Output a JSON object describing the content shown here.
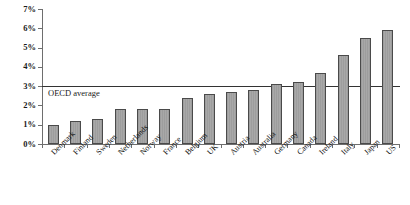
{
  "chart_data": {
    "type": "bar",
    "title": "",
    "subtitle": "",
    "xlabel": "",
    "ylabel": "",
    "ylim": [
      0,
      7
    ],
    "ytick_labels": [
      "0%",
      "1%",
      "2%",
      "3%",
      "4%",
      "5%",
      "6%",
      "7%"
    ],
    "ytick_values": [
      0,
      1,
      2,
      3,
      4,
      5,
      6,
      7
    ],
    "grid": false,
    "legend": "none",
    "value_unit": "%",
    "categories": [
      "Denmark",
      "Finland",
      "Sweden",
      "Netherlands",
      "Norway",
      "France",
      "Belgium",
      "UK",
      "Austria",
      "Australia",
      "Germany",
      "Canada",
      "Ireland",
      "Italy",
      "Japan",
      "US"
    ],
    "values": [
      1.0,
      1.2,
      1.3,
      1.8,
      1.8,
      1.8,
      2.4,
      2.6,
      2.7,
      2.8,
      3.1,
      3.2,
      3.7,
      4.6,
      5.5,
      5.9
    ],
    "annotations": [
      {
        "name": "oecd-average-line",
        "label": "OECD average",
        "value": 3.0,
        "orientation": "horizontal",
        "color": "#333333"
      }
    ],
    "colors": {
      "bar_fill": "#a3a3a3",
      "bar_border": "#4a4a4a",
      "axis": "#6e6e6e",
      "text": "#111111",
      "background": "#ffffff",
      "reference_line": "#333333"
    }
  }
}
